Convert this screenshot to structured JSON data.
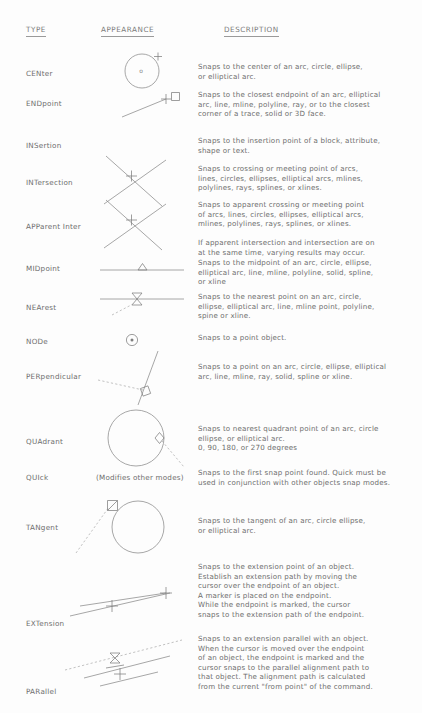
{
  "document": {
    "title": "AutoCAD Object Snap Modes Reference",
    "columns": {
      "type": "TYPE",
      "appearance": "APPEARANCE",
      "description": "DESCRIPTION"
    }
  },
  "rows": [
    {
      "type": "CENter",
      "icon": "center-snap-circle-icon",
      "description": "Snaps to the center of an arc, circle, ellipse,\nor elliptical arc."
    },
    {
      "type": "ENDpoint",
      "icon": "endpoint-snap-square-icon",
      "description": "Snaps to the closest endpoint of an arc, elliptical\narc, line, mline, polyline, ray, or to the closest\ncorner of  a trace, solid or 3D face."
    },
    {
      "type": "INSertion",
      "icon": "insertion-snap-icon",
      "description": "Snaps to the insertion point of a block, attribute,\nshape or text."
    },
    {
      "type": "INTersection",
      "icon": "intersection-snap-cross-icon",
      "description": "Snaps to crossing or meeting point of arcs,\nlines, circles, ellipses, elliptical arcs, mlines,\npolylines, rays, splines, or xlines."
    },
    {
      "type": "APParent Inter",
      "icon": "apparent-intersection-snap-cross-icon",
      "description": "Snaps to apparent crossing or meeting point\nof arcs, lines, circles, ellipses, elliptical arcs,\nmlines, polylines, rays, splines, or xlines.",
      "description_extra": "If apparent intersection and intersection are on\nat the same time, varying results may occur."
    },
    {
      "type": "MIDpoint",
      "icon": "midpoint-snap-triangle-icon",
      "description": "Snaps to the midpoint of an arc, circle, ellipse,\nelliptical arc, line, mline, polyline, solid, spline,\nor xline"
    },
    {
      "type": "NEArest",
      "icon": "nearest-snap-hourglass-icon",
      "description": "Snaps to the nearest point on an arc, circle,\nellipse, elliptical arc, line, mline point, polyline,\nspine or xline."
    },
    {
      "type": "NODe",
      "icon": "node-snap-dot-circle-icon",
      "description": "Snaps to a point object."
    },
    {
      "type": "PERpendicular",
      "icon": "perpendicular-snap-square-icon",
      "description": "Snaps to a point on an arc, circle, ellipse, elliptical\narc, line, mline, ray, solid, spline or xline."
    },
    {
      "type": "QUAdrant",
      "icon": "quadrant-snap-diamond-icon",
      "description": "Snaps to nearest quadrant point of an arc, circle\nellipse, or elliptical arc.\n0, 90, 180, or 270 degrees"
    },
    {
      "type": "QUIck",
      "modifier_note": "(Modifies other modes)",
      "icon": "quick-snap-icon",
      "description": "Snaps to the first snap point found.  Quick must be\nused in conjunction with other objects snap modes."
    },
    {
      "type": "TANgent",
      "icon": "tangent-snap-circle-icon",
      "description": "Snaps to the tangent of an arc, circle ellipse,\nor elliptical arc."
    },
    {
      "type": "EXTension",
      "icon": "extension-snap-line-icon",
      "description": "Snaps to the extension point of an object.\nEstablish an extension path by moving the\ncursor over the endpoint of an object.\nA marker is placed on the endpoint.\nWhile the endpoint is marked, the cursor\nsnaps to the extension path of the endpoint."
    },
    {
      "type": "PARallel",
      "icon": "parallel-snap-lines-icon",
      "description": "Snaps to an extension parallel with an object.\nWhen the cursor is moved over the endpoint\nof an object, the endpoint is marked and the\ncursor snaps to the parallel alignment path to\nthat object.  The alignment path is calculated\nfrom the current \"from point\" of the command."
    }
  ],
  "colors": {
    "background": "#fdfdfd",
    "text": "#6d6d6d",
    "line": "#8a8a8a",
    "dashed_line": "#a8a8a8"
  }
}
